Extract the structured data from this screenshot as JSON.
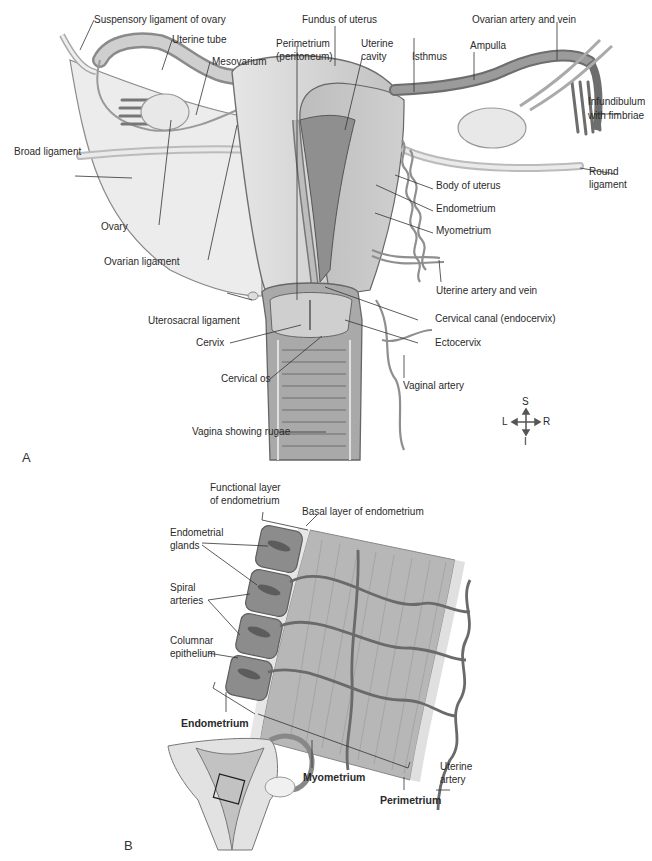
{
  "figure": {
    "panel_a": {
      "letter": "A",
      "labels": {
        "suspensory_ligament": "Suspensory ligament of ovary",
        "uterine_tube": "Uterine tube",
        "mesovarium": "Mesovarium",
        "perimetrium_1": "Perimetrium",
        "perimetrium_2": "(peritoneum)",
        "fundus": "Fundus of uterus",
        "uterine_cavity_1": "Uterine",
        "uterine_cavity_2": "cavity",
        "isthmus": "Isthmus",
        "ampulla": "Ampulla",
        "ovarian_artery": "Ovarian artery and vein",
        "infundibulum_1": "Infundibulum",
        "infundibulum_2": "with fimbriae",
        "broad_ligament": "Broad ligament",
        "round_ligament_1": "Round",
        "round_ligament_2": "ligament",
        "body_of_uterus": "Body of uterus",
        "endometrium": "Endometrium",
        "myometrium": "Myometrium",
        "ovary": "Ovary",
        "ovarian_ligament": "Ovarian ligament",
        "uterine_artery_vein": "Uterine artery and vein",
        "uterosacral_ligament": "Uterosacral ligament",
        "cervical_canal": "Cervical canal (endocervix)",
        "cervix": "Cervix",
        "ectocervix": "Ectocervix",
        "cervical_os": "Cervical os",
        "vaginal_artery": "Vaginal artery",
        "vagina": "Vagina showing rugae"
      },
      "compass": {
        "superior": "S",
        "inferior": "I",
        "left": "L",
        "right": "R"
      }
    },
    "panel_b": {
      "letter": "B",
      "labels": {
        "functional_layer_1": "Functional layer",
        "functional_layer_2": "of endometrium",
        "basal_layer": "Basal layer of endometrium",
        "endometrial_glands_1": "Endometrial",
        "endometrial_glands_2": "glands",
        "spiral_arteries_1": "Spiral",
        "spiral_arteries_2": "arteries",
        "columnar_epithelium_1": "Columnar",
        "columnar_epithelium_2": "epithelium",
        "endometrium": "Endometrium",
        "myometrium": "Myometrium",
        "perimetrium": "Perimetrium",
        "uterine_artery_1": "Uterine",
        "uterine_artery_2": "artery"
      }
    },
    "colors": {
      "tissue_light": "#d9d9d9",
      "tissue_mid": "#b5b5b5",
      "tissue_dark": "#8a8a8a",
      "vessel": "#6e6e6e",
      "leader_line": "#333333"
    }
  }
}
